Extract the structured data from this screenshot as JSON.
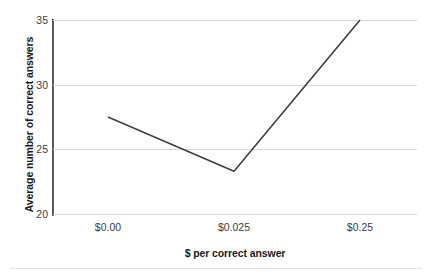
{
  "chart_data": {
    "type": "line",
    "title": "",
    "subtitle": "",
    "xlabel": "$ per correct answer",
    "ylabel": "Average number of correct answers",
    "categories": [
      "$0.00",
      "$0.025",
      "$0.25"
    ],
    "x_tick_labels": [
      "$0.00",
      "$0.025",
      "$0.25"
    ],
    "y_tick_labels": [
      "20",
      "25",
      "30",
      "35"
    ],
    "y_ticks": [
      20,
      25,
      30,
      35
    ],
    "ylim": [
      20,
      35
    ],
    "grid": "horizontal",
    "legend": "none",
    "series": [
      {
        "name": "Average number of correct answers",
        "values": [
          27.5,
          23.3,
          35.0
        ],
        "color": "#404040"
      }
    ]
  },
  "style": {
    "line_color": "#404040",
    "gridline_color": "#d9d9d9",
    "axis_color": "#595959",
    "text_color": "#1a1a1a",
    "tick_text_color": "#404040",
    "background": "#ffffff"
  }
}
